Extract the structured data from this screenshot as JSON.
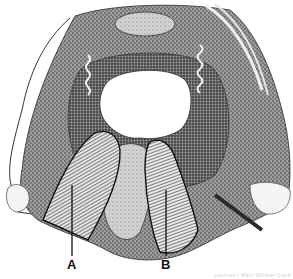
{
  "figure": {
    "style": "black-and-white stipple engraving",
    "regions": [
      {
        "id": "A",
        "label": "A",
        "fill": "diagonal-hatch",
        "position": "lower-left"
      },
      {
        "id": "B",
        "label": "B",
        "fill": "diagonal-hatch",
        "position": "lower-center"
      }
    ],
    "labels": {
      "a": "A",
      "b": "B"
    },
    "credit": "Lifelines / Mary Millikan Clark"
  },
  "colors": {
    "ink": "#1a1a1a",
    "tissue_dark": "#5a5a5a",
    "tissue_mid": "#8c8c8c",
    "tissue_light": "#c8c8c8",
    "paper": "#ffffff"
  }
}
